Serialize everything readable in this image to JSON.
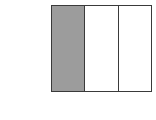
{
  "diagram": {
    "type": "fraction-model",
    "total_parts": 3,
    "shaded_parts": 1,
    "parts": [
      {
        "index": 0,
        "shaded": true
      },
      {
        "index": 1,
        "shaded": false
      },
      {
        "index": 2,
        "shaded": false
      }
    ],
    "colors": {
      "shaded": "#9c9c9c",
      "unshaded": "#ffffff",
      "outline": "#3a3a3a"
    }
  }
}
